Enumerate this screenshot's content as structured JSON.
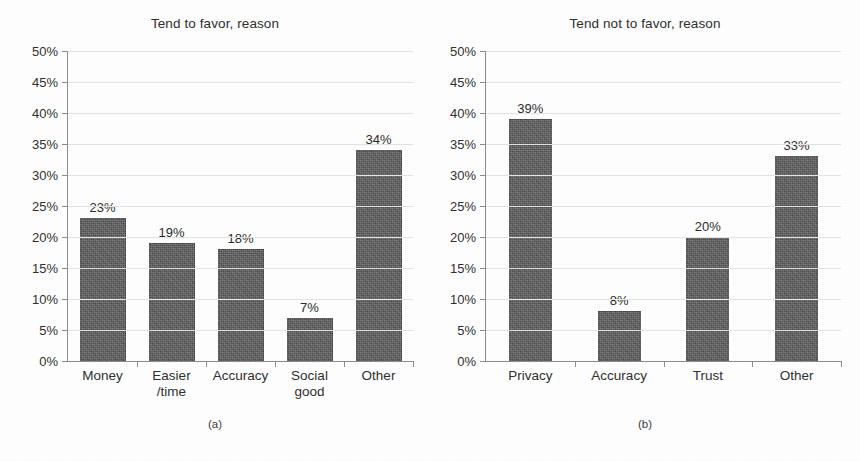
{
  "figure": {
    "panels": [
      {
        "id": "a",
        "title": "Tend to favor, reason",
        "subcaption": "(a)",
        "chart_data": {
          "type": "bar",
          "title": "Tend to favor, reason",
          "xlabel": "",
          "ylabel": "",
          "ylim": [
            0,
            50
          ],
          "ytick_step": 5,
          "ytick_labels": [
            "50%",
            "45%",
            "40%",
            "35%",
            "30%",
            "25%",
            "20%",
            "15%",
            "10%",
            "5%",
            "0%"
          ],
          "grid": true,
          "legend": "none",
          "categories": [
            "Money",
            "Easier\n/time",
            "Accuracy",
            "Social\ngood",
            "Other"
          ],
          "values": [
            23,
            19,
            18,
            7,
            34
          ],
          "value_labels": [
            "23%",
            "19%",
            "18%",
            "7%",
            "34%"
          ],
          "bar_color": "#5a5a5a"
        }
      },
      {
        "id": "b",
        "title": "Tend not to favor, reason",
        "subcaption": "(b)",
        "chart_data": {
          "type": "bar",
          "title": "Tend not to favor, reason",
          "xlabel": "",
          "ylabel": "",
          "ylim": [
            0,
            50
          ],
          "ytick_step": 5,
          "ytick_labels": [
            "50%",
            "45%",
            "40%",
            "35%",
            "30%",
            "25%",
            "20%",
            "15%",
            "10%",
            "5%",
            "0%"
          ],
          "grid": true,
          "legend": "none",
          "categories": [
            "Privacy",
            "Accuracy",
            "Trust",
            "Other"
          ],
          "values": [
            39,
            8,
            20,
            33
          ],
          "value_labels": [
            "39%",
            "8%",
            "20%",
            "33%"
          ],
          "bar_color": "#5a5a5a"
        }
      }
    ]
  },
  "chart_data": [
    {
      "type": "bar",
      "title": "Tend to favor, reason",
      "subcaption": "(a)",
      "categories": [
        "Money",
        "Easier/time",
        "Accuracy",
        "Social good",
        "Other"
      ],
      "values": [
        23,
        19,
        18,
        7,
        34
      ],
      "xlabel": "",
      "ylabel": "",
      "ylim": [
        0,
        50
      ],
      "grid": true
    },
    {
      "type": "bar",
      "title": "Tend not to favor, reason",
      "subcaption": "(b)",
      "categories": [
        "Privacy",
        "Accuracy",
        "Trust",
        "Other"
      ],
      "values": [
        39,
        8,
        20,
        33
      ],
      "xlabel": "",
      "ylabel": "",
      "ylim": [
        0,
        50
      ],
      "grid": true
    }
  ]
}
